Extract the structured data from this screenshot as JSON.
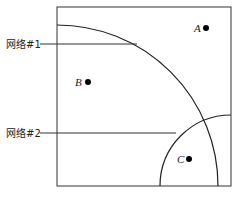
{
  "diagram": {
    "type": "network-coverage-regions",
    "networks": [
      {
        "id": "net1",
        "label": "网络#1",
        "center": [
          57,
          186
        ],
        "radius": 161
      },
      {
        "id": "net2",
        "label": "网络#2",
        "center": [
          231,
          186
        ],
        "radius": 71
      }
    ],
    "points": [
      {
        "id": "A",
        "label": "A",
        "x": 206,
        "y": 28
      },
      {
        "id": "B",
        "label": "B",
        "x": 88,
        "y": 82
      },
      {
        "id": "C",
        "label": "C",
        "x": 189,
        "y": 159
      }
    ],
    "colors": {
      "stroke": "#222222",
      "point": "#000000",
      "background": "#ffffff"
    }
  }
}
